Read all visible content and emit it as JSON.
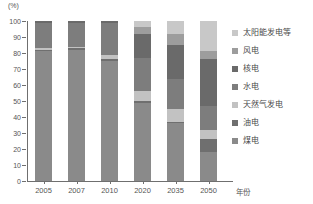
{
  "chart_data": {
    "type": "bar",
    "stacked": true,
    "title": "",
    "subtitle": "",
    "xlabel": "年份",
    "ylabel": "(%)",
    "ylim": [
      0,
      100
    ],
    "ytick_labels": [
      "0",
      "10",
      "20",
      "30",
      "40",
      "50",
      "60",
      "70",
      "80",
      "90",
      "100"
    ],
    "yticks": [
      0,
      10,
      20,
      30,
      40,
      50,
      60,
      70,
      80,
      90,
      100
    ],
    "grid": false,
    "legend_position": "right",
    "categories": [
      "2005",
      "2007",
      "2010",
      "2020",
      "2035",
      "2050"
    ],
    "series": [
      {
        "name": "煤电",
        "color": "#8a8a8a",
        "values": [
          81,
          82,
          75,
          49,
          36,
          18
        ]
      },
      {
        "name": "油电",
        "color": "#6f6f6f",
        "values": [
          1,
          1,
          1,
          1,
          1,
          8
        ]
      },
      {
        "name": "天然气发电",
        "color": "#c2c2c2",
        "values": [
          1,
          1,
          3,
          6,
          8,
          6
        ]
      },
      {
        "name": "水电",
        "color": "#7d7d7d",
        "values": [
          16,
          15,
          20,
          21,
          19,
          15
        ]
      },
      {
        "name": "核电",
        "color": "#6a6a6a",
        "values": [
          1,
          1,
          1,
          15,
          21,
          29
        ]
      },
      {
        "name": "风电",
        "color": "#9d9d9d",
        "values": [
          0,
          0,
          0,
          4,
          7,
          5
        ]
      },
      {
        "name": "太阳能发电等",
        "color": "#c8c8c8",
        "values": [
          0,
          0,
          0,
          4,
          8,
          19
        ]
      }
    ]
  },
  "legend": {
    "items": [
      {
        "label": "太阳能发电等",
        "color": "#c8c8c8"
      },
      {
        "label": "风电",
        "color": "#9d9d9d"
      },
      {
        "label": "核电",
        "color": "#6a6a6a"
      },
      {
        "label": "水电",
        "color": "#7d7d7d"
      },
      {
        "label": "天然气发电",
        "color": "#c2c2c2"
      },
      {
        "label": "油电",
        "color": "#6f6f6f"
      },
      {
        "label": "煤电",
        "color": "#8a8a8a"
      }
    ]
  },
  "axis": {
    "unit_label": "(%)",
    "x_title": "年份"
  }
}
